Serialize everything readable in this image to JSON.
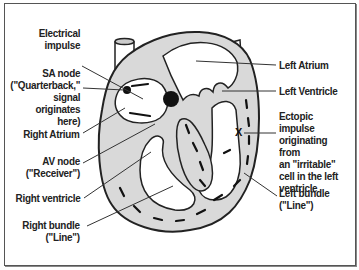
{
  "diagram": {
    "colors": {
      "muscle": "#d9d9d9",
      "outline": "#222222",
      "background": "#ffffff"
    },
    "labels_left": [
      {
        "id": "electrical-impulse",
        "text": "Electrical\nimpulse"
      },
      {
        "id": "sa-node",
        "text": "SA node\n(\"Quarterback,\"\nsignal originates\nhere)"
      },
      {
        "id": "right-atrium",
        "text": "Right Atrium"
      },
      {
        "id": "av-node",
        "text": "AV node\n(\"Receiver\")"
      },
      {
        "id": "right-ventricle",
        "text": "Right ventricle"
      },
      {
        "id": "right-bundle",
        "text": "Right bundle\n(\"Line\")"
      }
    ],
    "labels_right": [
      {
        "id": "left-atrium",
        "text": "Left Atrium"
      },
      {
        "id": "left-ventricle",
        "text": "Left Ventricle"
      },
      {
        "id": "ectopic-impulse",
        "text": "Ectopic impulse\noriginating from\nan \"irritable\"\ncell in the left\nventricle"
      },
      {
        "id": "left-bundle",
        "text": "Left bundle\n(\"Line\")"
      }
    ],
    "marker": "X"
  }
}
